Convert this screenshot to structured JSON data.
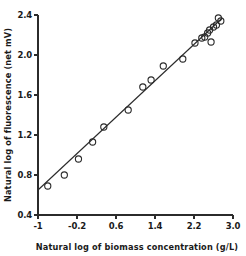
{
  "chart_data": {
    "type": "scatter",
    "title": "",
    "xlabel": "Natural log of biomass concentration (g/L)",
    "ylabel": "Natural log of fluorescence (net mV)",
    "xlim": [
      -1.0,
      3.0
    ],
    "ylim": [
      0.4,
      2.4
    ],
    "xticks": [
      -1,
      -0.2,
      0.6,
      1.4,
      2.2,
      3.0
    ],
    "xticklabels": [
      "-1",
      "-0.2",
      "0.6",
      "1.4",
      "2.2",
      "3.0"
    ],
    "yticks": [
      0.4,
      0.8,
      1.2,
      1.6,
      2.0,
      2.4
    ],
    "yticklabels": [
      "0.4",
      "0.8",
      "1.2",
      "1.6",
      "2.0",
      "2.4"
    ],
    "grid": false,
    "legend": false,
    "marker": "open-circle",
    "series": [
      {
        "name": "observations",
        "x": [
          -0.8,
          -0.46,
          -0.17,
          0.12,
          0.35,
          0.85,
          1.15,
          1.32,
          1.57,
          1.97,
          2.22,
          2.36,
          2.42,
          2.48,
          2.52,
          2.55,
          2.6,
          2.66,
          2.7,
          2.75
        ],
        "y": [
          0.69,
          0.8,
          0.96,
          1.13,
          1.28,
          1.45,
          1.68,
          1.75,
          1.89,
          1.96,
          2.12,
          2.17,
          2.18,
          2.22,
          2.25,
          2.13,
          2.28,
          2.3,
          2.37,
          2.34
        ]
      }
    ],
    "fit_line": {
      "name": "regression-line",
      "x_start": -1.0,
      "y_start": 0.65,
      "x_end": 2.78,
      "y_end": 2.37
    }
  },
  "axes": {
    "x_title": "Natural log of biomass concentration (g/L)",
    "y_title": "Natural log of fluorescence (net mV)"
  }
}
